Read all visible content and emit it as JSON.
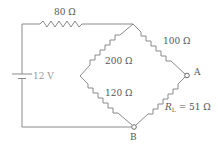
{
  "diagram": {
    "type": "circuit",
    "title": "",
    "source": {
      "label": "12 V",
      "voltage": "12 V"
    },
    "resistors": [
      {
        "id": "series",
        "label": "80 Ω",
        "value": "80 Ω"
      },
      {
        "id": "top-right",
        "label": "100 Ω",
        "value": "100 Ω"
      },
      {
        "id": "top-left",
        "label": "200 Ω",
        "value": "200 Ω"
      },
      {
        "id": "bottom-left",
        "label": "120 Ω",
        "value": "120 Ω"
      },
      {
        "id": "load",
        "label_main": "R",
        "label_sub": "L",
        "label_rest": " = 51 Ω",
        "value": "51 Ω"
      }
    ],
    "nodes": [
      {
        "id": "A",
        "label": "A"
      },
      {
        "id": "B",
        "label": "B"
      }
    ],
    "colors": {
      "wire": "#8a8a8a",
      "text": "#555555",
      "source_text": "#9a9a9a",
      "background": "#ffffff"
    }
  }
}
